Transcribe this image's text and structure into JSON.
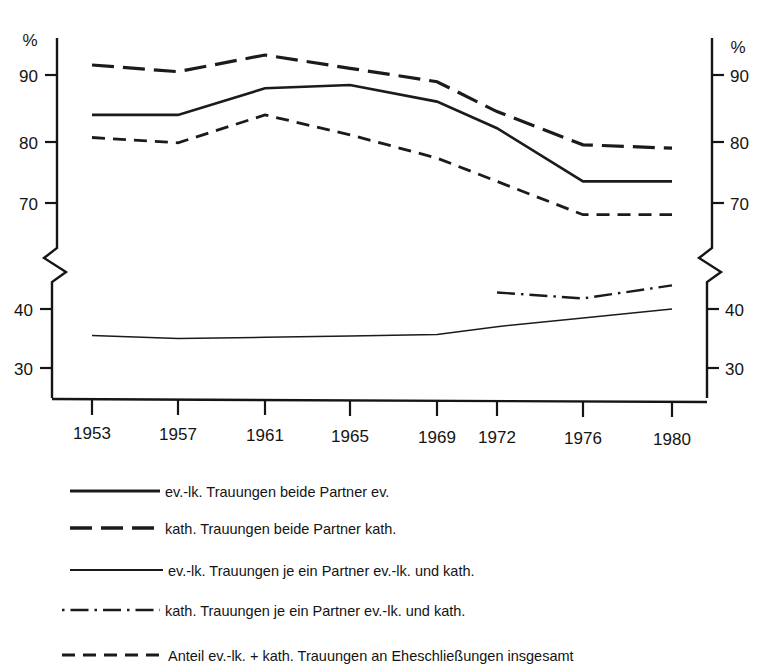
{
  "chart_data": {
    "type": "line",
    "title": "",
    "subtitle": "",
    "xlabel": "",
    "ylabel": "%",
    "ylabel_right": "%",
    "grid": false,
    "legend_position": "below",
    "axis_break": true,
    "x": [
      "1953",
      "1957",
      "1961",
      "1965",
      "1969",
      "1972",
      "1976",
      "1980"
    ],
    "categories": [
      "1953",
      "1957",
      "1961",
      "1965",
      "1969",
      "1972",
      "1976",
      "1980"
    ],
    "y_ticks_left": [
      "90",
      "80",
      "70",
      "40",
      "30"
    ],
    "y_ticks_right": [
      "90",
      "80",
      "70",
      "40",
      "30"
    ],
    "ylim_upper": [
      65,
      96
    ],
    "ylim_lower": [
      27,
      48
    ],
    "series": [
      {
        "name": "ev.-lk. Trauungen beide Partner ev.",
        "style": "solid-thick",
        "values": [
          84,
          84,
          88,
          88.5,
          86,
          82,
          74,
          74
        ]
      },
      {
        "name": "kath. Trauungen beide Partner kath.",
        "style": "long-dash",
        "values": [
          91.5,
          90.5,
          93,
          91,
          89,
          84.5,
          79.5,
          79
        ]
      },
      {
        "name": "ev.-lk. Trauungen je ein Partner ev.-lk. und kath.",
        "style": "solid-thin",
        "values": [
          35.5,
          35,
          35.2,
          35.4,
          35.7,
          37,
          38.5,
          40
        ]
      },
      {
        "name": "kath. Trauungen je ein Partner ev.-lk. und kath.",
        "style": "dash-dot",
        "values": [
          null,
          null,
          null,
          null,
          null,
          42.8,
          41.8,
          44
        ]
      },
      {
        "name": "Anteil ev.-lk. + kath. Trauungen an Eheschließungen insgesamt",
        "style": "short-dash",
        "values": [
          80.6,
          79.8,
          84,
          81,
          77.5,
          74,
          69,
          69
        ]
      }
    ]
  },
  "axes": {
    "left_unit": "%",
    "right_unit": "%",
    "ticks": [
      {
        "label": "90",
        "y": 75
      },
      {
        "label": "80",
        "y": 142
      },
      {
        "label": "70",
        "y": 203
      },
      {
        "label": "40",
        "y": 309
      },
      {
        "label": "30",
        "y": 368
      }
    ],
    "xticks": [
      {
        "label": "1953",
        "x": 92
      },
      {
        "label": "1957",
        "x": 178
      },
      {
        "label": "1961",
        "x": 265
      },
      {
        "label": "1965",
        "x": 350
      },
      {
        "label": "1969",
        "x": 437
      },
      {
        "label": "1972",
        "x": 497
      },
      {
        "label": "1976",
        "x": 583
      },
      {
        "label": "1980",
        "x": 672
      }
    ]
  },
  "legend": {
    "items": [
      {
        "style": "solid-thick",
        "label": "ev.-lk. Trauungen beide Partner ev."
      },
      {
        "style": "long-dash",
        "label": "kath. Trauungen beide Partner kath."
      },
      {
        "style": "solid-thin",
        "label": "ev.-lk. Trauungen je ein Partner ev.-lk. und kath."
      },
      {
        "style": "dash-dot",
        "label": "kath. Trauungen je ein Partner ev.-lk. und kath."
      },
      {
        "style": "short-dash",
        "label": "Anteil ev.-lk. + kath. Trauungen an Eheschließungen insgesamt"
      }
    ]
  }
}
